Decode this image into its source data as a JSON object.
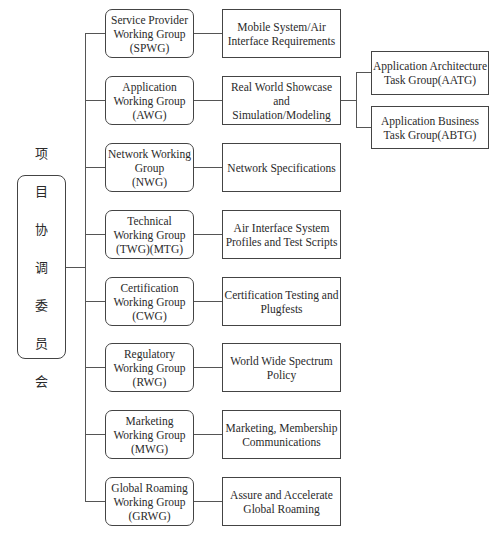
{
  "root": {
    "label": "项目协调委员会",
    "chars": [
      "项",
      "目",
      "协",
      "调",
      "委",
      "员",
      "会"
    ]
  },
  "groups": [
    {
      "name": "Service Provider\nWorking Group\n(SPWG)",
      "task": "Mobile System/Air\nInterface Requirements"
    },
    {
      "name": "Application\nWorking Group\n(AWG)",
      "task": "Real World Showcase\nand Simulation/Modeling",
      "subgroups": [
        "Application Architecture\nTask Group(AATG)",
        "Application Business\nTask Group(ABTG)"
      ]
    },
    {
      "name": "Network Working\nGroup\n(NWG)",
      "task": "Network Specifications"
    },
    {
      "name": "Technical\nWorking Group\n(TWG)(MTG)",
      "task": "Air Interface System\nProfiles and Test Scripts"
    },
    {
      "name": "Certification\nWorking Group\n(CWG)",
      "task": "Certification Testing and\nPlugfests"
    },
    {
      "name": "Regulatory\nWorking Group\n(RWG)",
      "task": "World Wide Spectrum\nPolicy"
    },
    {
      "name": "Marketing\nWorking Group\n(MWG)",
      "task": "Marketing, Membership\nCommunications"
    },
    {
      "name": "Global Roaming\nWorking Group\n(GRWG)",
      "task": "Assure and Accelerate\nGlobal Roaming"
    }
  ]
}
